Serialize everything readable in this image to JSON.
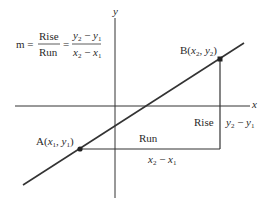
{
  "formula": {
    "lhs": "m",
    "eq": "=",
    "frac1_num": "Rise",
    "frac1_den": "Run",
    "frac2_num": {
      "a": "y",
      "a_sub": "2",
      "op": " − ",
      "b": "y",
      "b_sub": "1"
    },
    "frac2_den": {
      "a": "x",
      "a_sub": "2",
      "op": " − ",
      "b": "x",
      "b_sub": "1"
    }
  },
  "axes": {
    "x_label": "x",
    "y_label": "y"
  },
  "points": {
    "A": {
      "name": "A",
      "open": "(",
      "x": "x",
      "x_sub": "1",
      "sep": ", ",
      "y": "y",
      "y_sub": "1",
      "close": ")"
    },
    "B": {
      "name": "B",
      "open": "(",
      "x": "x",
      "x_sub": "2",
      "sep": ", ",
      "y": "y",
      "y_sub": "2",
      "close": ")"
    }
  },
  "labels": {
    "run": "Run",
    "rise": "Rise",
    "run_expr": {
      "a": "x",
      "a_sub": "2",
      "op": " − ",
      "b": "x",
      "b_sub": "1"
    },
    "rise_expr": {
      "a": "y",
      "a_sub": "2",
      "op": " − ",
      "b": "y",
      "b_sub": "1"
    }
  },
  "colors": {
    "line": "#333333",
    "text": "#2a2a2a",
    "background": "#ffffff"
  }
}
